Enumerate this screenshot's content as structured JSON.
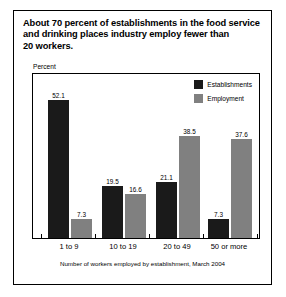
{
  "title_lines": [
    "About 70 percent of establishments in the food service",
    "and drinking places industry employ fewer than",
    "20 workers."
  ],
  "axis": {
    "y_label": "Percent",
    "footnote": "Number of workers employed by establishment, March 2004"
  },
  "legend": {
    "items": [
      {
        "label": "Establishments",
        "color": "#1a1a1a"
      },
      {
        "label": "Employment",
        "color": "#808080"
      }
    ]
  },
  "chart_data": {
    "type": "bar",
    "title": "About 70 percent of establishments in the food service and drinking places industry employ fewer than 20 workers.",
    "xlabel": "Number of workers employed by establishment, March 2004",
    "ylabel": "Percent",
    "ylim": [
      0,
      62
    ],
    "grid": false,
    "legend_position": "top-right inside plot",
    "categories": [
      "1 to 9",
      "10 to 19",
      "20 to 49",
      "50 or more"
    ],
    "series": [
      {
        "name": "Establishments",
        "color": "#1a1a1a",
        "values": [
          52.1,
          19.5,
          21.1,
          7.3
        ],
        "labels": [
          "52.1",
          "19.5",
          "21.1",
          "7.3"
        ]
      },
      {
        "name": "Employment",
        "color": "#808080",
        "values": [
          7.3,
          16.6,
          38.5,
          37.6
        ],
        "labels": [
          "7.3",
          "16.6",
          "38.5",
          "37.6"
        ]
      }
    ]
  }
}
